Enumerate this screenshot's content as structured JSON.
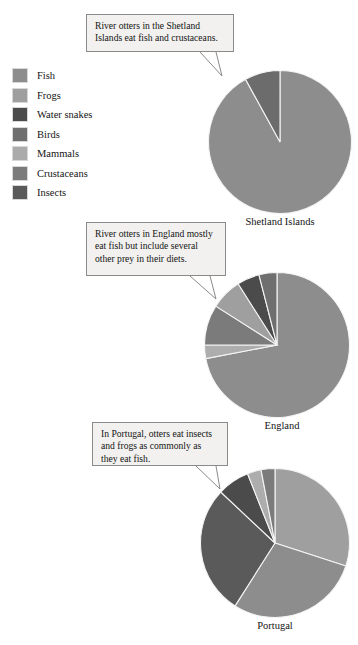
{
  "legend": {
    "items": [
      {
        "label": "Fish",
        "color": "#8d8d8d"
      },
      {
        "label": "Frogs",
        "color": "#9f9f9f"
      },
      {
        "label": "Water snakes",
        "color": "#4b4b4b"
      },
      {
        "label": "Birds",
        "color": "#6f6f6f"
      },
      {
        "label": "Mammals",
        "color": "#ababab"
      },
      {
        "label": "Crustaceans",
        "color": "#7b7b7b"
      },
      {
        "label": "Insects",
        "color": "#5a5a5a"
      }
    ]
  },
  "callouts": [
    {
      "id": "shetland-callout",
      "text": "River otters in the Shetland Islands eat fish and crustaceans."
    },
    {
      "id": "england-callout",
      "text": "River otters in England mostly eat fish but include several other prey in their diets."
    },
    {
      "id": "portugal-callout",
      "text": "In Portugal, otters eat insects and frogs as commonly as they eat fish."
    }
  ],
  "chart_data": [
    {
      "type": "pie",
      "title": "Shetland Islands",
      "categories": [
        "Fish",
        "Crustaceans"
      ],
      "values": [
        92,
        8
      ],
      "colors": [
        "#8d8d8d",
        "#6c6c6c"
      ],
      "start_angle": 0,
      "legend_position": "top-left"
    },
    {
      "type": "pie",
      "title": "England",
      "categories": [
        "Fish",
        "Mammals",
        "Crustaceans",
        "Frogs",
        "Water snakes",
        "Birds"
      ],
      "values": [
        72,
        3,
        9,
        7,
        5,
        4
      ],
      "colors": [
        "#8d8d8d",
        "#adadad",
        "#7b7b7b",
        "#9f9f9f",
        "#4b4b4b",
        "#6f6f6f"
      ],
      "start_angle": 0,
      "legend_position": "top-left"
    },
    {
      "type": "pie",
      "title": "Portugal",
      "categories": [
        "Fish",
        "Frogs",
        "Insects",
        "Water snakes",
        "Mammals",
        "Crustaceans"
      ],
      "values": [
        30,
        29,
        28,
        7,
        3,
        3
      ],
      "colors": [
        "#9f9f9f",
        "#8d8d8d",
        "#5a5a5a",
        "#4b4b4b",
        "#adadad",
        "#7b7b7b"
      ],
      "start_angle": 0,
      "legend_position": "top-left"
    }
  ]
}
